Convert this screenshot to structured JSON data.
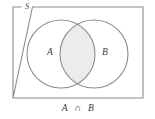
{
  "figure": {
    "kind": "venn-diagram",
    "caption": "A ∩ B",
    "caption_parts": {
      "left_set": "A",
      "operator": "∩",
      "right_set": "B"
    },
    "universe_label": "S",
    "sets": [
      {
        "id": "A",
        "label": "A",
        "label_x": 50,
        "label_y": 53,
        "cx": 61,
        "cy": 54,
        "r": 34
      },
      {
        "id": "B",
        "label": "B",
        "label_x": 105,
        "label_y": 53,
        "cx": 94,
        "cy": 54,
        "r": 34
      }
    ],
    "universe_rect": {
      "x": 13,
      "y": 7,
      "width": 130,
      "height": 91
    },
    "universe_label_x": 27,
    "universe_label_y": 7,
    "shaded_region": "intersection",
    "colors": {
      "background": "#ffffff",
      "stroke": "#8c8c8c",
      "rect_stroke": "#8c8c8c",
      "shade_fill": "#ececec",
      "circle_fill": "#ffffff",
      "text": "#3a3a3a"
    }
  }
}
